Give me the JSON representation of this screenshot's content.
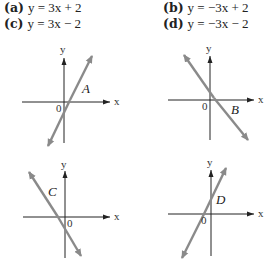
{
  "choices": [
    {
      "label": "(a)",
      "equation": "y = 3x + 2"
    },
    {
      "label": "(b)",
      "equation": "y = −3x + 2"
    },
    {
      "label": "(c)",
      "equation": "y = 3x − 2"
    },
    {
      "label": "(d)",
      "equation": "y = −3x − 2"
    }
  ],
  "graphs": [
    {
      "name": "A",
      "x_label": "x",
      "y_label": "y",
      "origin_label": "0",
      "slope": "positive",
      "y_intercept": "negative"
    },
    {
      "name": "B",
      "x_label": "x",
      "y_label": "y",
      "origin_label": "0",
      "slope": "negative",
      "y_intercept": "positive"
    },
    {
      "name": "C",
      "x_label": "x",
      "y_label": "y",
      "origin_label": "0",
      "slope": "negative",
      "y_intercept": "negative"
    },
    {
      "name": "D",
      "x_label": "x",
      "y_label": "y",
      "origin_label": "0",
      "slope": "positive",
      "y_intercept": "positive"
    }
  ],
  "colors": {
    "axis": "#222222",
    "line": "#8a8a8a"
  }
}
